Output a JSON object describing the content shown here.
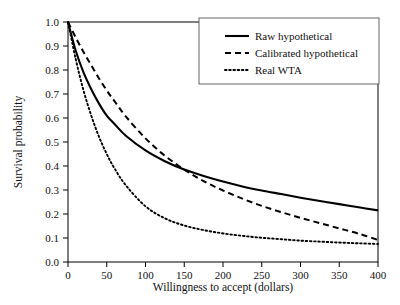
{
  "chart_data": {
    "type": "line",
    "title": "",
    "xlabel": "Willingness to accept (dollars)",
    "ylabel": "Survival probability",
    "xlim": [
      0,
      400
    ],
    "ylim": [
      0.0,
      1.0
    ],
    "grid": false,
    "legend_position": "top-right",
    "xticks": [
      0,
      50,
      100,
      150,
      200,
      250,
      300,
      350,
      400
    ],
    "xticklabels": [
      "0",
      "50",
      "100",
      "150",
      "200",
      "250",
      "300",
      "350",
      "400"
    ],
    "yticks": [
      0.0,
      0.1,
      0.2,
      0.3,
      0.4,
      0.5,
      0.6,
      0.7,
      0.8,
      0.9,
      1.0
    ],
    "yticklabels": [
      "0.0",
      "0.1",
      "0.2",
      "0.3",
      "0.4",
      "0.5",
      "0.6",
      "0.7",
      "0.8",
      "0.9",
      "1.0"
    ],
    "x": [
      0,
      10,
      20,
      30,
      40,
      50,
      60,
      75,
      100,
      125,
      150,
      175,
      200,
      225,
      250,
      275,
      300,
      325,
      350,
      375,
      400
    ],
    "series": [
      {
        "name": "Raw hypothetical",
        "style": "solid",
        "color": "#000000",
        "values": [
          1.0,
          0.88,
          0.79,
          0.72,
          0.66,
          0.61,
          0.575,
          0.525,
          0.465,
          0.42,
          0.385,
          0.358,
          0.335,
          0.315,
          0.298,
          0.283,
          0.268,
          0.254,
          0.241,
          0.228,
          0.215
        ]
      },
      {
        "name": "Calibrated hypothetical",
        "style": "dashed",
        "color": "#000000",
        "values": [
          1.0,
          0.935,
          0.875,
          0.82,
          0.765,
          0.715,
          0.67,
          0.605,
          0.515,
          0.443,
          0.385,
          0.337,
          0.298,
          0.264,
          0.234,
          0.208,
          0.184,
          0.162,
          0.14,
          0.118,
          0.092
        ]
      },
      {
        "name": "Real WTA",
        "style": "dotted",
        "color": "#000000",
        "values": [
          1.0,
          0.845,
          0.715,
          0.61,
          0.522,
          0.45,
          0.39,
          0.318,
          0.232,
          0.182,
          0.152,
          0.133,
          0.119,
          0.109,
          0.101,
          0.095,
          0.089,
          0.085,
          0.081,
          0.078,
          0.075
        ]
      }
    ],
    "legend": [
      {
        "label": "Raw hypothetical",
        "style": "solid"
      },
      {
        "label": "Calibrated hypothetical",
        "style": "dashed"
      },
      {
        "label": "Real WTA",
        "style": "dotted"
      }
    ]
  }
}
